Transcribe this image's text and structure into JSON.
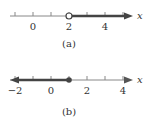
{
  "figures": [
    {
      "id": "a",
      "caption": "(a)",
      "variable": "x",
      "tick_labels": [
        "0",
        "2",
        "4"
      ],
      "tick_values": [
        -1,
        0,
        1,
        2,
        3,
        4,
        5
      ],
      "endpoint": {
        "value": 2,
        "style": "open"
      },
      "ray_direction": "right",
      "inequality": "x > 2"
    },
    {
      "id": "b",
      "caption": "(b)",
      "variable": "x",
      "tick_labels": [
        "−2",
        "0",
        "2",
        "4"
      ],
      "tick_values": [
        -2,
        -1,
        0,
        1,
        2,
        3,
        4
      ],
      "endpoint": {
        "value": 1,
        "style": "closed"
      },
      "ray_direction": "left",
      "inequality": "x ≤ 1"
    }
  ],
  "colors": {
    "axis": "#777777",
    "ray": "#444444",
    "text": "#333333"
  }
}
